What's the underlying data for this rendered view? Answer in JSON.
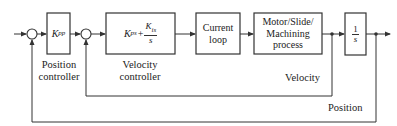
{
  "diagram": {
    "type": "control block diagram",
    "blocks": {
      "position_controller": {
        "gain_symbol": "K",
        "gain_sub": "pp",
        "caption_line1": "Position",
        "caption_line2": "controller"
      },
      "velocity_controller": {
        "k1": "K",
        "k1_sub": "ps",
        "plus": "+",
        "k2": "K",
        "k2_sub": "is",
        "den": "s",
        "caption_line1": "Velocity",
        "caption_line2": "controller"
      },
      "current_loop": {
        "line1": "Current",
        "line2": "loop"
      },
      "plant": {
        "line1": "Motor/Slide/",
        "line2": "Machining",
        "line3": "process"
      },
      "integrator": {
        "num": "1",
        "den": "s"
      }
    },
    "signals": {
      "velocity_label": "Velocity",
      "position_label": "Position"
    }
  }
}
